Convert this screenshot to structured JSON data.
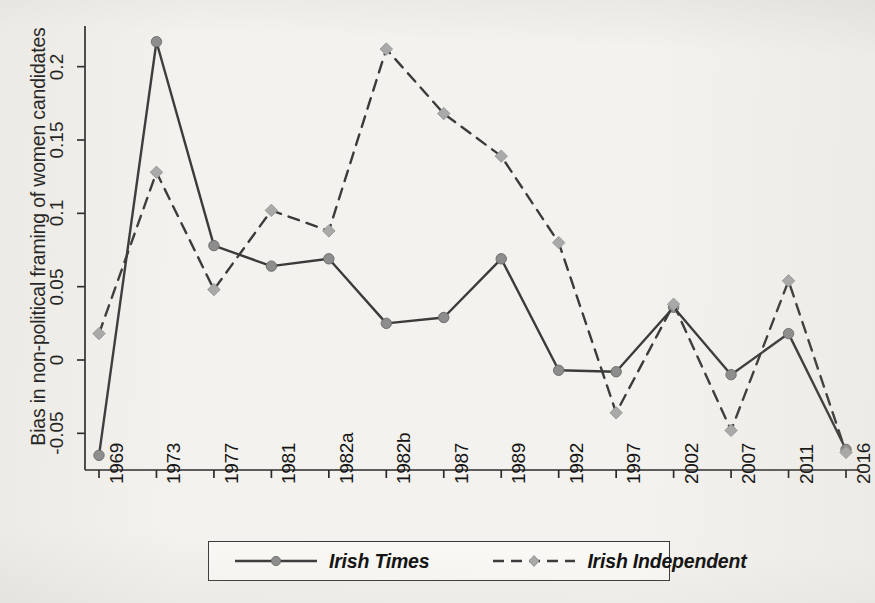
{
  "chart_data": {
    "type": "line",
    "title": "",
    "xlabel": "",
    "ylabel": "Bias in non-political framing of women candidates",
    "categories": [
      "1969",
      "1973",
      "1977",
      "1981",
      "1982a",
      "1982b",
      "1987",
      "1989",
      "1992",
      "1997",
      "2002",
      "2007",
      "2011",
      "2016"
    ],
    "ylim": [
      -0.075,
      0.225
    ],
    "yticks": [
      0.2,
      0.15,
      0.1,
      0.05,
      0,
      -0.05
    ],
    "ytick_labels": [
      "0.2",
      "0.15",
      "0.1",
      "0.05",
      "0",
      "-0.05"
    ],
    "grid": false,
    "legend_position": "bottom",
    "series": [
      {
        "name": "Irish Times",
        "style": "solid",
        "color": "#3b3b3b",
        "marker_color": "#8d8d8d",
        "marker": "circle",
        "values": [
          -0.065,
          0.217,
          0.078,
          0.064,
          0.069,
          0.025,
          0.029,
          0.069,
          -0.007,
          -0.008,
          0.036,
          -0.01,
          0.018,
          -0.061
        ]
      },
      {
        "name": "Irish Independent",
        "style": "dashed",
        "color": "#3b3b3b",
        "marker_color": "#a9a9a9",
        "marker": "diamond",
        "values": [
          0.018,
          0.128,
          0.048,
          0.102,
          0.088,
          0.212,
          0.168,
          0.139,
          0.08,
          -0.036,
          0.038,
          -0.048,
          0.054,
          -0.063
        ]
      }
    ]
  },
  "axis": {
    "y_label": "Bias in non-political framing of women candidates",
    "y_tick_labels": [
      "0.2",
      "0.15",
      "0.1",
      "0.05",
      "0",
      "-0.05"
    ],
    "x_tick_labels": [
      "1969",
      "1973",
      "1977",
      "1981",
      "1982a",
      "1982b",
      "1987",
      "1989",
      "1992",
      "1997",
      "2002",
      "2007",
      "2011",
      "2016"
    ]
  },
  "legend": {
    "items": [
      {
        "label": "Irish Times",
        "style": "solid"
      },
      {
        "label": "Irish Independent",
        "style": "dashed"
      }
    ]
  },
  "colors": {
    "background": "#f4f2ee",
    "line": "#3b3b3b",
    "marker_times": "#8d8d8d",
    "marker_independent": "#a9a9a9",
    "axis": "#2b2b2b"
  }
}
